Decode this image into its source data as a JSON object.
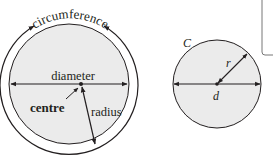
{
  "left_diagram": {
    "labels": {
      "circumference": "circumference",
      "diameter": "diameter",
      "centre": "centre",
      "radius": "radius"
    }
  },
  "right_diagram": {
    "labels": {
      "circumference_symbol": "C",
      "radius_symbol": "r",
      "diameter_symbol": "d"
    }
  },
  "colors": {
    "circle_fill": "#ebebeb",
    "stroke": "#231f20",
    "background": "#ffffff"
  }
}
